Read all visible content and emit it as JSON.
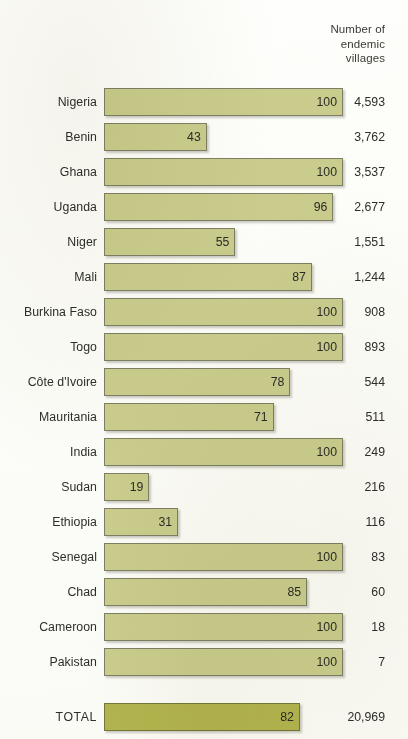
{
  "header": {
    "line1": "Number of",
    "line2": "endemic",
    "line3": "villages"
  },
  "colors": {
    "bar_fill": "#c9cc8c",
    "bar_border": "#7d7f63",
    "total_fill": "#b2b44e",
    "total_border": "#74763a",
    "text": "#2e2e2a",
    "background": "#fdfdfb"
  },
  "chart_data": {
    "type": "bar",
    "orientation": "horizontal",
    "title": "",
    "xlabel": "",
    "ylabel": "",
    "xlim": [
      0,
      100
    ],
    "grid": false,
    "legend": null,
    "value_column_header": "Number of endemic villages",
    "categories": [
      "Nigeria",
      "Benin",
      "Ghana",
      "Uganda",
      "Niger",
      "Mali",
      "Burkina Faso",
      "Togo",
      "Côte d'Ivoire",
      "Mauritania",
      "India",
      "Sudan",
      "Ethiopia",
      "Senegal",
      "Chad",
      "Cameroon",
      "Pakistan"
    ],
    "values": [
      100,
      43,
      100,
      96,
      55,
      87,
      100,
      100,
      78,
      71,
      100,
      19,
      31,
      100,
      85,
      100,
      100
    ],
    "value_labels": [
      "100",
      "43",
      "100",
      "96",
      "55",
      "87",
      "100",
      "100",
      "78",
      "71",
      "100",
      "19",
      "31",
      "100",
      "85",
      "100",
      "100"
    ],
    "secondary_column": [
      "4,593",
      "3,762",
      "3,537",
      "2,677",
      "1,551",
      "1,244",
      "908",
      "893",
      "544",
      "511",
      "249",
      "216",
      "116",
      "83",
      "60",
      "18",
      "7"
    ],
    "total": {
      "label": "TOTAL",
      "value": 82,
      "value_label": "82",
      "secondary": "20,969"
    }
  }
}
